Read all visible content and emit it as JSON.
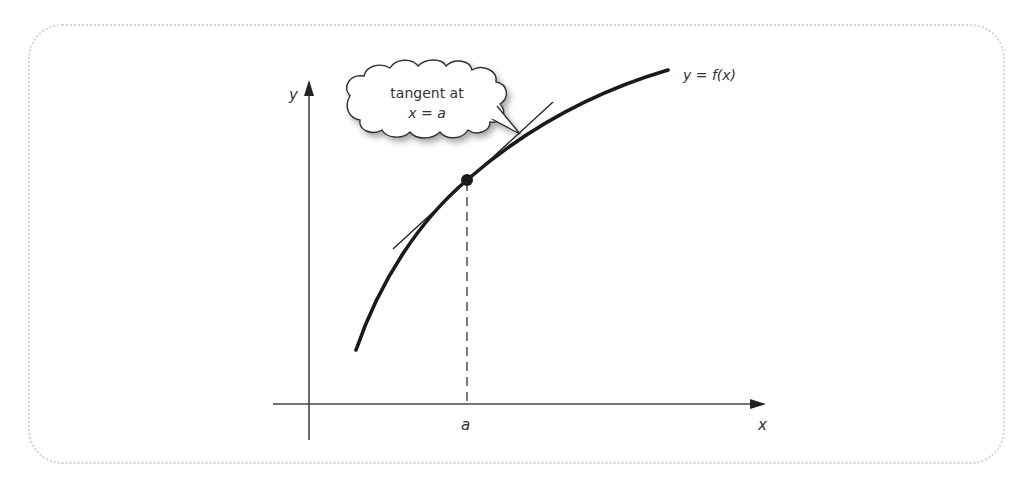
{
  "diagram": {
    "axes": {
      "x_label": "x",
      "y_label": "y"
    },
    "curve": {
      "label": "y = f(x)"
    },
    "point": {
      "x_label": "a"
    },
    "callout": {
      "line1": "tangent at",
      "line2": "x = a"
    },
    "colors": {
      "ink": "#1a1a1a",
      "frame": "#d4d4d4",
      "text": "#333333"
    }
  }
}
